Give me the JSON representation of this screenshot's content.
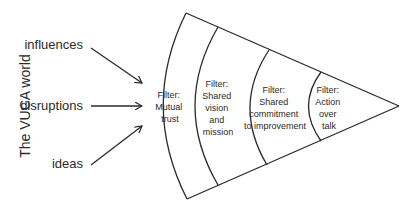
{
  "diagram": {
    "side_title": "The VUCA world",
    "inputs": [
      {
        "label": "influences"
      },
      {
        "label": "disruptions"
      },
      {
        "label": "ideas"
      }
    ],
    "filters": [
      {
        "lines": [
          "Filter:",
          "Mutual",
          "trust"
        ]
      },
      {
        "lines": [
          "Filter:",
          "Shared",
          "vision",
          "and",
          "mission"
        ]
      },
      {
        "lines": [
          "Filter:",
          "Shared",
          "commitment",
          "to improvement"
        ]
      },
      {
        "lines": [
          "Filter:",
          "Action",
          "over",
          "talk"
        ]
      }
    ],
    "colors": {
      "line": "#2a2a2a",
      "background": "#ffffff"
    }
  }
}
